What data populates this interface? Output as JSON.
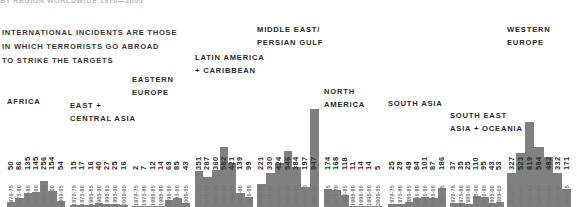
{
  "top_title": "BY REGION WORLDWIDE 1970—2005",
  "caption": [
    "INTERNATIONAL INCIDENTS ARE THOSE",
    "IN WHICH TERRORISTS GO ABROAD",
    "TO STRIKE THE TARGETS"
  ],
  "colors": {
    "bar": "#808080",
    "text": "#2b2b2b",
    "period_text": "#767676",
    "background": "#ffffff"
  },
  "chart_data": {
    "type": "bar",
    "title": "BY REGION WORLDWIDE 1970—2005",
    "xlabel": "",
    "ylabel": "",
    "grid": false,
    "legend": "none",
    "categories": [
      "1970-75",
      "1975-80",
      "1980-85",
      "1985-90",
      "1990-95",
      "1995-00",
      "2000-05"
    ],
    "ylim": [
      0,
      947
    ],
    "series": [
      {
        "name": "AFRICA",
        "label_lines": [
          "AFRICA"
        ],
        "values": [
          50,
          86,
          135,
          145,
          256,
          154,
          54
        ]
      },
      {
        "name": "EAST + CENTRAL ASIA",
        "label_lines": [
          "EAST +",
          "CENTRAL ASIA"
        ],
        "values": [
          15,
          17,
          16,
          40,
          27,
          25,
          16
        ]
      },
      {
        "name": "EASTERN EUROPE",
        "label_lines": [
          "EASTERN",
          "EUROPE"
        ],
        "values": [
          2,
          7,
          12,
          14,
          69,
          85,
          43
        ]
      },
      {
        "name": "LATIN AMERICA + CARIBBEAN",
        "label_lines": [
          "LATIN AMERICA",
          "+ CARIBBEAN"
        ],
        "values": [
          351,
          287,
          360,
          582,
          421,
          139,
          99
        ]
      },
      {
        "name": "MIDDLE EAST/PERSIAN GULF",
        "label_lines": [
          "MIDDLE EAST/",
          "PERSIAN GULF"
        ],
        "values": [
          221,
          330,
          424,
          546,
          384,
          197,
          947
        ]
      },
      {
        "name": "NORTH AMERICA",
        "label_lines": [
          "NORTH",
          "AMERICA"
        ],
        "values": [
          174,
          168,
          118,
          11,
          14,
          14,
          5
        ]
      },
      {
        "name": "SOUTH ASIA",
        "label_lines": [
          "SOUTH ASIA"
        ],
        "values": [
          25,
          29,
          49,
          84,
          101,
          87,
          186
        ]
      },
      {
        "name": "SOUTH EAST ASIA + OCEANIA",
        "label_lines": [
          "SOUTH EAST",
          "ASIA + OCEANIA"
        ],
        "values": [
          37,
          35,
          25,
          110,
          95,
          43,
          53
        ]
      },
      {
        "name": "WESTERN EUROPE",
        "label_lines": [
          "WESTERN",
          "EUROPE"
        ],
        "values": [
          327,
          523,
          819,
          584,
          482,
          332,
          171
        ]
      }
    ]
  },
  "layout": {
    "group_x": [
      5,
      68,
      130,
      193,
      255,
      322,
      386,
      448,
      505
    ],
    "group_width": [
      58,
      58,
      58,
      58,
      62,
      58,
      58,
      54,
      64
    ],
    "label_top": [
      96,
      100,
      74,
      52,
      24,
      86,
      98,
      110,
      24
    ]
  }
}
